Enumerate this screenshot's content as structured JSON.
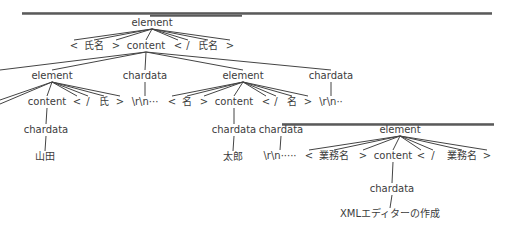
{
  "diagram": {
    "type": "parse-tree",
    "rules": [
      {
        "x": 22,
        "y": 12,
        "w": 470
      },
      {
        "x": 150,
        "y": 14,
        "w": 92
      },
      {
        "x": 282,
        "y": 123,
        "w": 212
      }
    ],
    "nodes": [
      {
        "id": "root",
        "label": "element",
        "x": 152,
        "y": 17
      },
      {
        "id": "r_lt",
        "label": "<",
        "x": 74,
        "y": 40
      },
      {
        "id": "r_name",
        "label": "氏名",
        "x": 94,
        "y": 40
      },
      {
        "id": "r_gt",
        "label": ">",
        "x": 116,
        "y": 40
      },
      {
        "id": "r_content",
        "label": "content",
        "x": 146,
        "y": 40
      },
      {
        "id": "r_lt2",
        "label": "<",
        "x": 178,
        "y": 40
      },
      {
        "id": "r_slash",
        "label": "/",
        "x": 188,
        "y": 40
      },
      {
        "id": "r_name2",
        "label": "氏名",
        "x": 208,
        "y": 40
      },
      {
        "id": "r_gt2",
        "label": ">",
        "x": 230,
        "y": 40
      },
      {
        "id": "e1",
        "label": "element",
        "x": 52,
        "y": 70
      },
      {
        "id": "cd1",
        "label": "chardata",
        "x": 145,
        "y": 70
      },
      {
        "id": "e2",
        "label": "element",
        "x": 243,
        "y": 70
      },
      {
        "id": "cd2",
        "label": "chardata",
        "x": 331,
        "y": 70
      },
      {
        "id": "e1_content",
        "label": "content",
        "x": 47,
        "y": 96
      },
      {
        "id": "e1_lt",
        "label": "<",
        "x": 77,
        "y": 96
      },
      {
        "id": "e1_slash",
        "label": "/",
        "x": 88,
        "y": 96
      },
      {
        "id": "e1_name",
        "label": "氏",
        "x": 104,
        "y": 96
      },
      {
        "id": "e1_gt",
        "label": ">",
        "x": 120,
        "y": 96
      },
      {
        "id": "cd1_text",
        "label": "\\r\\n···",
        "x": 145,
        "y": 96
      },
      {
        "id": "e2_lt",
        "label": "<",
        "x": 172,
        "y": 96
      },
      {
        "id": "e2_name",
        "label": "名",
        "x": 187,
        "y": 96
      },
      {
        "id": "e2_gt",
        "label": ">",
        "x": 204,
        "y": 96
      },
      {
        "id": "e2_content",
        "label": "content",
        "x": 234,
        "y": 96
      },
      {
        "id": "e2_lt2",
        "label": "<",
        "x": 266,
        "y": 96
      },
      {
        "id": "e2_slash",
        "label": "/",
        "x": 276,
        "y": 96
      },
      {
        "id": "e2_name2",
        "label": "名",
        "x": 292,
        "y": 96
      },
      {
        "id": "e2_gt2",
        "label": ">",
        "x": 308,
        "y": 96
      },
      {
        "id": "cd2_text",
        "label": "\\r\\n··",
        "x": 331,
        "y": 96
      },
      {
        "id": "e1_cd",
        "label": "chardata",
        "x": 46,
        "y": 124
      },
      {
        "id": "e2_cd",
        "label": "chardata",
        "x": 234,
        "y": 124
      },
      {
        "id": "cd3",
        "label": "chardata",
        "x": 281,
        "y": 124
      },
      {
        "id": "e3",
        "label": "element",
        "x": 400,
        "y": 124
      },
      {
        "id": "e1_val",
        "label": "山田",
        "x": 45,
        "y": 151
      },
      {
        "id": "e2_val",
        "label": "太郎",
        "x": 233,
        "y": 151
      },
      {
        "id": "cd3_text",
        "label": "\\r\\n·····",
        "x": 280,
        "y": 150
      },
      {
        "id": "e3_lt",
        "label": "<",
        "x": 309,
        "y": 150
      },
      {
        "id": "e3_name",
        "label": "業務名",
        "x": 334,
        "y": 150
      },
      {
        "id": "e3_gt",
        "label": ">",
        "x": 363,
        "y": 150
      },
      {
        "id": "e3_content",
        "label": "content",
        "x": 393,
        "y": 150
      },
      {
        "id": "e3_lt2",
        "label": "<",
        "x": 421,
        "y": 150
      },
      {
        "id": "e3_slash",
        "label": "/",
        "x": 433,
        "y": 150
      },
      {
        "id": "e3_name2",
        "label": "業務名",
        "x": 462,
        "y": 150
      },
      {
        "id": "e3_gt2",
        "label": ">",
        "x": 487,
        "y": 150
      },
      {
        "id": "e3_cd",
        "label": "chardata",
        "x": 392,
        "y": 183
      },
      {
        "id": "e3_val",
        "label": "XMLエディターの作成",
        "x": 390,
        "y": 208
      }
    ],
    "edges": [
      [
        "root",
        "r_lt"
      ],
      [
        "root",
        "r_name"
      ],
      [
        "root",
        "r_gt"
      ],
      [
        "root",
        "r_content"
      ],
      [
        "root",
        "r_lt2"
      ],
      [
        "root",
        "r_slash"
      ],
      [
        "root",
        "r_name2"
      ],
      [
        "root",
        "r_gt2"
      ],
      [
        "r_content",
        "e1"
      ],
      [
        "r_content",
        "cd1"
      ],
      [
        "r_content",
        "e2"
      ],
      [
        "r_content",
        "cd2"
      ],
      [
        "e1",
        "e1_content"
      ],
      [
        "e1",
        "e1_lt"
      ],
      [
        "e1",
        "e1_slash"
      ],
      [
        "e1",
        "e1_name"
      ],
      [
        "e1",
        "e1_gt"
      ],
      [
        "cd1",
        "cd1_text"
      ],
      [
        "e2",
        "e2_lt"
      ],
      [
        "e2",
        "e2_name"
      ],
      [
        "e2",
        "e2_gt"
      ],
      [
        "e2",
        "e2_content"
      ],
      [
        "e2",
        "e2_lt2"
      ],
      [
        "e2",
        "e2_slash"
      ],
      [
        "e2",
        "e2_name2"
      ],
      [
        "e2",
        "e2_gt2"
      ],
      [
        "cd2",
        "cd2_text"
      ],
      [
        "e1_content",
        "e1_cd"
      ],
      [
        "e2_content",
        "e2_cd"
      ],
      [
        "e1_cd",
        "e1_val"
      ],
      [
        "e2_cd",
        "e2_val"
      ],
      [
        "cd3",
        "cd3_text"
      ],
      [
        "e3",
        "e3_lt"
      ],
      [
        "e3",
        "e3_name"
      ],
      [
        "e3",
        "e3_gt"
      ],
      [
        "e3",
        "e3_content"
      ],
      [
        "e3",
        "e3_lt2"
      ],
      [
        "e3",
        "e3_slash"
      ],
      [
        "e3",
        "e3_name2"
      ],
      [
        "e3",
        "e3_gt2"
      ],
      [
        "e3_content",
        "e3_cd"
      ],
      [
        "e3_cd",
        "e3_val"
      ]
    ],
    "offscreen_edges": [
      {
        "from": "e1",
        "to_x": 0,
        "to_y": 100
      },
      {
        "from": "e1",
        "to_x": 0,
        "to_y": 104
      },
      {
        "from": "r_content",
        "to_x": 0,
        "to_y": 70
      }
    ]
  }
}
